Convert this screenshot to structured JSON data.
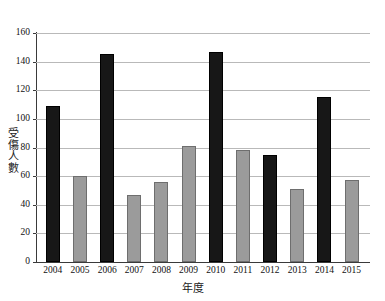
{
  "chart_data": {
    "type": "bar",
    "title": "",
    "xlabel": "年度",
    "ylabel": "受傷人數",
    "ylim": [
      0,
      160
    ],
    "ytick_step": 20,
    "yticks": [
      0,
      20,
      40,
      60,
      80,
      100,
      120,
      140,
      160
    ],
    "grid": true,
    "legend": "none",
    "categories": [
      "2004",
      "2005",
      "2006",
      "2007",
      "2008",
      "2009",
      "2010",
      "2011",
      "2012",
      "2013",
      "2014",
      "2015"
    ],
    "values": [
      109,
      60,
      145,
      47,
      56,
      81,
      147,
      78,
      75,
      51,
      115,
      57
    ],
    "bar_styles": [
      "dark",
      "light",
      "dark",
      "light",
      "light",
      "light",
      "dark",
      "light",
      "dark",
      "light",
      "dark",
      "light"
    ],
    "colors": {
      "dark_bar": "#171717",
      "light_bar": "#9b9b9b",
      "light_bar_border": "#6e6e6e",
      "gridline": "#b9b9b9",
      "axis": "#3a3a3a",
      "background": "#ffffff",
      "text": "#111111"
    }
  }
}
